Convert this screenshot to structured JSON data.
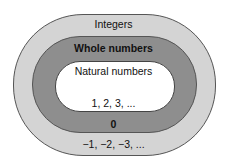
{
  "diagram": {
    "type": "nested-sets",
    "sets": [
      {
        "name": "Integers",
        "extra_elements": "−1, −2, −3, ..."
      },
      {
        "name": "Whole numbers",
        "extra_elements": "0"
      },
      {
        "name": "Natural numbers",
        "elements": "1, 2, 3, ..."
      }
    ],
    "labels": {
      "integers": "Integers",
      "whole": "Whole numbers",
      "natural": "Natural numbers",
      "natural_elements": "1, 2, 3, ...",
      "zero": "0",
      "negatives": "−1, −2, −3, ..."
    },
    "colors": {
      "integers_fill": "#d4d4d4",
      "whole_fill": "#8e8e8e",
      "natural_fill": "#ffffff",
      "border": "#555555"
    }
  }
}
